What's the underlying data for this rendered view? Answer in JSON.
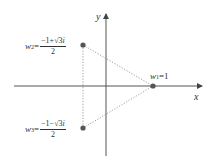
{
  "diagram": {
    "axes": {
      "x_label": "x",
      "y_label": "y"
    },
    "points": [
      {
        "id": "w1",
        "name": "w",
        "subscript": "1",
        "equals": "=",
        "value": "1",
        "x": 153,
        "y": 86
      },
      {
        "id": "w2",
        "name": "w",
        "subscript": "2",
        "equals": "=",
        "numerator": "−1+√3i",
        "numerator_pre": "−1+",
        "numerator_sqrt": "√3",
        "numerator_post": "i",
        "denominator": "2",
        "x": 83,
        "y": 45
      },
      {
        "id": "w3",
        "name": "w",
        "subscript": "3",
        "equals": "=",
        "numerator": "−1−√3i",
        "numerator_pre": "−1−",
        "numerator_sqrt": "√3",
        "numerator_post": "i",
        "denominator": "2",
        "x": 83,
        "y": 128
      }
    ],
    "colors": {
      "axis": "#555555",
      "point": "#555555",
      "dotted": "#888888",
      "text": "#333333"
    }
  }
}
